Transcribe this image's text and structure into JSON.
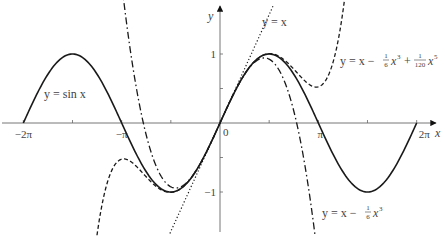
{
  "chart_data": {
    "type": "line",
    "title": "",
    "xlabel": "x",
    "ylabel": "y",
    "xlim": [
      -6.98,
      6.98
    ],
    "ylim": [
      -1.65,
      1.8
    ],
    "grid": false,
    "legend_position": "inline annotations",
    "x_ticks": [
      {
        "value": -6.2832,
        "label": "−2π"
      },
      {
        "value": -4.7124,
        "label": ""
      },
      {
        "value": -3.1416,
        "label": "−π"
      },
      {
        "value": -1.5708,
        "label": ""
      },
      {
        "value": 0,
        "label": "0"
      },
      {
        "value": 1.5708,
        "label": ""
      },
      {
        "value": 3.1416,
        "label": "π"
      },
      {
        "value": 4.7124,
        "label": ""
      },
      {
        "value": 6.2832,
        "label": "2π"
      }
    ],
    "y_ticks": [
      {
        "value": 1,
        "label": "1"
      },
      {
        "value": 0.5,
        "label": ""
      },
      {
        "value": -0.5,
        "label": ""
      },
      {
        "value": -1,
        "label": "−1"
      }
    ],
    "series": [
      {
        "name": "y = sin x",
        "style": "solid",
        "expr": "sin",
        "x_range": [
          -6.2832,
          6.2832
        ]
      },
      {
        "name": "y = x",
        "style": "dotted",
        "expr": "linear",
        "x_range": [
          -1.6,
          1.72
        ]
      },
      {
        "name": "y = x − (1/6)x³",
        "style": "dashdot",
        "expr": "cubic",
        "x_range": [
          -3.35,
          3.35
        ]
      },
      {
        "name": "y = x − (1/6)x³ + (1/120)x⁵",
        "style": "dashed",
        "expr": "quintic",
        "x_range": [
          -4.08,
          4.08
        ]
      }
    ],
    "sample_points": {
      "x": [
        -6.2832,
        -4.7124,
        -3.1416,
        -1.5708,
        0,
        1.5708,
        3.1416,
        4.7124,
        6.2832
      ],
      "sin": [
        0,
        1,
        0,
        -1,
        0,
        1,
        0,
        -1,
        0
      ]
    },
    "annotations": [
      {
        "id": "sin",
        "text_main": "y = sin x"
      },
      {
        "id": "linear",
        "text_main": "y = x"
      },
      {
        "id": "cubic",
        "text_main": "y = x −",
        "frac_num": "1",
        "frac_den": "6",
        "tail": "x",
        "tail_exp": "3"
      },
      {
        "id": "quintic",
        "text_main": "y = x −",
        "frac1_num": "1",
        "frac1_den": "6",
        "mid": "x",
        "mid_exp": "3",
        "plus": "+",
        "frac2_num": "1",
        "frac2_den": "120",
        "tail": "x",
        "tail_exp": "5"
      }
    ]
  },
  "layout": {
    "origin_px": [
      220,
      123
    ],
    "x_scale_px": 31.3,
    "y_scale_px": 69,
    "stroke_color": "#222222",
    "axis_color": "#555555",
    "label_color": "#444444"
  }
}
